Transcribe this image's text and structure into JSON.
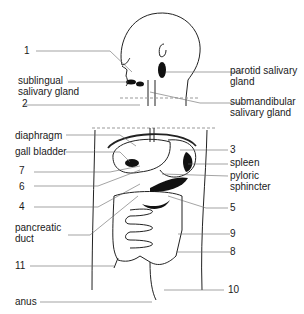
{
  "diagram": {
    "labels": {
      "l1": "1",
      "sublingual_1": "sublingual",
      "sublingual_2": "salivary gland",
      "l2": "2",
      "parotid_1": "parotid salivary",
      "parotid_2": "gland",
      "submandibular_1": "submandibular",
      "submandibular_2": "salivary gland",
      "diaphragm": "diaphragm",
      "gall_bladder": "gall bladder",
      "l7": "7",
      "l6": "6",
      "l4": "4",
      "pancreatic_1": "pancreatic",
      "pancreatic_2": "duct",
      "l11": "11",
      "anus": "anus",
      "l3": "3",
      "spleen": "spleen",
      "pyloric_1": "pyloric",
      "pyloric_2": "sphincter",
      "l5": "5",
      "l9": "9",
      "l8": "8",
      "l10": "10"
    }
  }
}
